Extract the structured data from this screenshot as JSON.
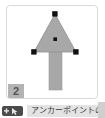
{
  "panel": {
    "step_badge": "2",
    "background_color": "#ffffff",
    "border_color": "#d9d9d9"
  },
  "illustration": {
    "name": "arrow-shape-with-anchor-points",
    "shape_fill_color": "#a8a8a8",
    "shape_stroke_color": "#8f8f8f",
    "anchor_color": "#111111",
    "triangle": {
      "apex": {
        "x": 54,
        "y": 13
      },
      "left": {
        "x": 33,
        "y": 51
      },
      "right": {
        "x": 76,
        "y": 51
      }
    },
    "stem": {
      "x": 48,
      "y": 51,
      "width": 13,
      "height": 38
    },
    "anchor_points": [
      {
        "name": "apex-anchor",
        "x": 54,
        "y": 13
      },
      {
        "name": "left-anchor",
        "x": 33,
        "y": 51
      },
      {
        "name": "right-anchor",
        "x": 76,
        "y": 51
      },
      {
        "name": "center-anchor",
        "x": 55,
        "y": 38
      }
    ]
  },
  "caption": {
    "tool_icon": "direct-selection-pen-cursor-icon",
    "tool_chip_color": "#4a4a4a",
    "text": "アンカーポイントの",
    "pill_color": "#e3e3e3"
  }
}
